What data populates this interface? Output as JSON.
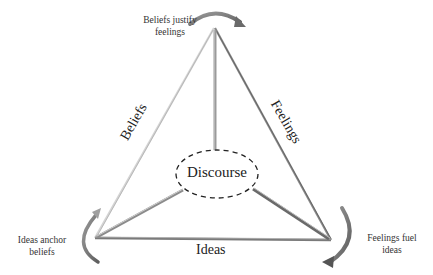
{
  "diagram": {
    "type": "triangle-cycle",
    "center": {
      "label": "Discourse"
    },
    "sides": {
      "left": "Beliefs",
      "right": "Feelings",
      "bottom": "Ideas"
    },
    "vertex_annotations": {
      "top": {
        "line1": "Beliefs justify",
        "line2": "feelings"
      },
      "bottom_left": {
        "line1": "Ideas anchor",
        "line2": "beliefs"
      },
      "bottom_right": {
        "line1": "Feelings fuel",
        "line2": "ideas"
      }
    },
    "colors": {
      "line_dark": "#6e6e6e",
      "line_light": "#c8c8c8",
      "arrow": "#7a7a7a",
      "text": "#222222"
    }
  }
}
